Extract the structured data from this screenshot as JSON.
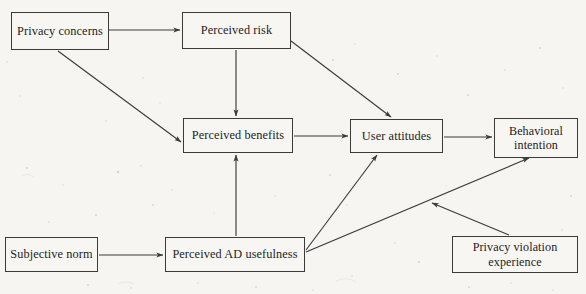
{
  "diagram": {
    "type": "path-model",
    "background_color": "#f6f5f2",
    "stroke_color": "#3b3b3b",
    "nodes": [
      {
        "id": "privacy_concerns",
        "label": "Privacy concerns",
        "x": 11,
        "y": 12,
        "w": 98,
        "h": 38
      },
      {
        "id": "perceived_risk",
        "label": "Perceived risk",
        "x": 182,
        "y": 12,
        "w": 109,
        "h": 37
      },
      {
        "id": "perceived_benefits",
        "label": "Perceived benefits",
        "x": 183,
        "y": 118,
        "w": 110,
        "h": 35
      },
      {
        "id": "user_attitudes",
        "label": "User attitudes",
        "x": 350,
        "y": 119,
        "w": 93,
        "h": 34
      },
      {
        "id": "behavioral_intention",
        "label": "Behavioral\nintention",
        "x": 494,
        "y": 118,
        "w": 84,
        "h": 40
      },
      {
        "id": "subjective_norm",
        "label": "Subjective norm",
        "x": 5,
        "y": 237,
        "w": 93,
        "h": 35
      },
      {
        "id": "perceived_ad_usefulness",
        "label": "Perceived AD usefulness",
        "x": 165,
        "y": 237,
        "w": 140,
        "h": 35
      },
      {
        "id": "privacy_violation_experience",
        "label": "Privacy violation\nexperience",
        "x": 452,
        "y": 236,
        "w": 126,
        "h": 37
      }
    ],
    "edges": [
      {
        "id": "e1",
        "from": "privacy_concerns",
        "to": "perceived_risk",
        "x1": 109,
        "y1": 30,
        "x2": 180,
        "y2": 30,
        "arrow": true
      },
      {
        "id": "e2",
        "from": "privacy_concerns",
        "to": "perceived_benefits",
        "x1": 58,
        "y1": 51,
        "x2": 181,
        "y2": 142,
        "arrow": true
      },
      {
        "id": "e3",
        "from": "perceived_risk",
        "to": "perceived_benefits",
        "x1": 236,
        "y1": 50,
        "x2": 236,
        "y2": 116,
        "arrow": true
      },
      {
        "id": "e4",
        "from": "perceived_risk",
        "to": "user_attitudes",
        "x1": 291,
        "y1": 41,
        "x2": 392,
        "y2": 117,
        "arrow": true
      },
      {
        "id": "e5",
        "from": "perceived_benefits",
        "to": "user_attitudes",
        "x1": 294,
        "y1": 136,
        "x2": 348,
        "y2": 136,
        "arrow": true
      },
      {
        "id": "e6",
        "from": "user_attitudes",
        "to": "behavioral_intention",
        "x1": 444,
        "y1": 137,
        "x2": 492,
        "y2": 137,
        "arrow": true
      },
      {
        "id": "e7",
        "from": "subjective_norm",
        "to": "perceived_ad_usefulness",
        "x1": 99,
        "y1": 255,
        "x2": 163,
        "y2": 255,
        "arrow": true
      },
      {
        "id": "e8",
        "from": "perceived_ad_usefulness",
        "to": "perceived_benefits",
        "x1": 236,
        "y1": 236,
        "x2": 236,
        "y2": 155,
        "arrow": true
      },
      {
        "id": "e9",
        "from": "perceived_ad_usefulness",
        "to": "user_attitudes",
        "x1": 306,
        "y1": 250,
        "x2": 377,
        "y2": 155,
        "arrow": true
      },
      {
        "id": "e10",
        "from": "perceived_ad_usefulness",
        "to": "behavioral_intention",
        "x1": 306,
        "y1": 252,
        "x2": 529,
        "y2": 158,
        "arrow": true
      },
      {
        "id": "e11",
        "from": "privacy_violation_experience",
        "to": "e10",
        "x1": 509,
        "y1": 235,
        "x2": 431,
        "y2": 203,
        "arrow": true,
        "moderator": true
      }
    ]
  }
}
